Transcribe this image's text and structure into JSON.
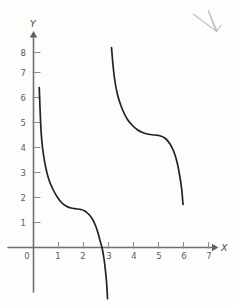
{
  "figure": {
    "medium": "hand-drawn pencil graph on paper",
    "background_color": "#fdfdfc",
    "curve_color": "#232323",
    "axis_color": "#6f7172",
    "label_color": "#5b5d5e",
    "x_axis_label": "X",
    "y_axis_label": "Y",
    "origin_label": "0",
    "stray_mark_name": "pencil-check-mark"
  },
  "chart_data": {
    "type": "line",
    "title": "",
    "xlabel": "X",
    "ylabel": "Y",
    "xlim": [
      0,
      7.6
    ],
    "ylim": [
      -2.2,
      8.6
    ],
    "grid": false,
    "legend": null,
    "x_ticks": [
      0,
      1,
      2,
      3,
      4,
      5,
      6,
      7
    ],
    "x_tick_labels": [
      "0",
      "1",
      "2",
      "3",
      "4",
      "5",
      "6",
      "7"
    ],
    "y_ticks": [
      1,
      2,
      3,
      4,
      5,
      6,
      7,
      8
    ],
    "y_tick_labels": [
      "1",
      "2",
      "3",
      "4",
      "5",
      "6",
      "7",
      "8"
    ],
    "annotations": [
      "curve has a vertical asymptote near x = 3",
      "left branch plateaus near y = 1.55 between x = 1.3 and x = 2.1",
      "left branch crosses the x-axis at about x = 2.75",
      "right branch plateaus near y = 4.5 between x = 4.6 and x = 5.2"
    ],
    "series": [
      {
        "name": "left-branch",
        "points": [
          [
            0.23,
            6.4
          ],
          [
            0.26,
            5.6
          ],
          [
            0.29,
            4.9
          ],
          [
            0.33,
            4.3
          ],
          [
            0.4,
            3.7
          ],
          [
            0.5,
            3.15
          ],
          [
            0.62,
            2.7
          ],
          [
            0.78,
            2.32
          ],
          [
            0.95,
            2.02
          ],
          [
            1.12,
            1.8
          ],
          [
            1.3,
            1.66
          ],
          [
            1.5,
            1.58
          ],
          [
            1.7,
            1.55
          ],
          [
            1.9,
            1.52
          ],
          [
            2.05,
            1.46
          ],
          [
            2.2,
            1.34
          ],
          [
            2.35,
            1.15
          ],
          [
            2.48,
            0.88
          ],
          [
            2.58,
            0.58
          ],
          [
            2.66,
            0.28
          ],
          [
            2.74,
            0.0
          ],
          [
            2.82,
            -0.45
          ],
          [
            2.88,
            -0.95
          ],
          [
            2.93,
            -1.5
          ],
          [
            2.96,
            -2.05
          ]
        ]
      },
      {
        "name": "right-branch",
        "points": [
          [
            3.12,
            8.0
          ],
          [
            3.18,
            7.3
          ],
          [
            3.25,
            6.7
          ],
          [
            3.34,
            6.2
          ],
          [
            3.46,
            5.78
          ],
          [
            3.6,
            5.42
          ],
          [
            3.76,
            5.12
          ],
          [
            3.94,
            4.9
          ],
          [
            4.14,
            4.72
          ],
          [
            4.36,
            4.6
          ],
          [
            4.6,
            4.53
          ],
          [
            4.85,
            4.5
          ],
          [
            5.08,
            4.46
          ],
          [
            5.28,
            4.36
          ],
          [
            5.46,
            4.14
          ],
          [
            5.62,
            3.82
          ],
          [
            5.75,
            3.38
          ],
          [
            5.85,
            2.86
          ],
          [
            5.93,
            2.32
          ],
          [
            5.98,
            1.72
          ]
        ]
      }
    ]
  }
}
